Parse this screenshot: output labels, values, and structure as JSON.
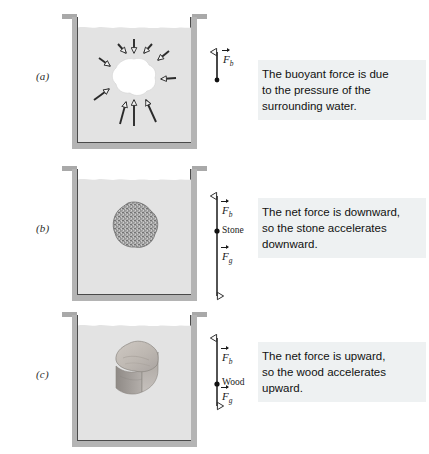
{
  "figure": {
    "background": "#ffffff",
    "width": 429,
    "height": 454
  },
  "palette": {
    "water": "#e3e3e3",
    "glass_wall": "#b4b4b4",
    "glass_rim": "#a9a9a9",
    "glass_outline": "#4a4a4a",
    "caption_background": "#eef1f2",
    "ink": "#1a1a1a",
    "stone_fill": "#9b9b9b",
    "wood_top": "#c3bdb7",
    "wood_side": "#9a948e"
  },
  "panels": [
    {
      "id": "a",
      "label": "(a)",
      "body": {
        "name": "water-cavity",
        "kind": "void",
        "description": "white irregular blob of water, same shape as the submerged body"
      },
      "arrows": {
        "name": "pressure-arrows",
        "direction": "inward",
        "count": 10,
        "arrowhead": "hollow-triangle"
      },
      "forces": [
        {
          "symbol": "F",
          "subscript": "b",
          "label": "F_b",
          "direction": "up",
          "length_px": 30,
          "arrowhead": "hollow-triangle"
        }
      ],
      "application_point": {
        "name": "application-point-dot",
        "marker": "filled-dot",
        "body_label": ""
      },
      "caption": [
        "The buoyant force is due",
        "to the pressure of the",
        "surrounding water."
      ]
    },
    {
      "id": "b",
      "label": "(b)",
      "body": {
        "name": "stone",
        "kind": "stone",
        "description": "speckled granular gray rock, denser than water"
      },
      "forces": [
        {
          "symbol": "F",
          "subscript": "b",
          "label": "F_b",
          "direction": "up",
          "length_px": 36,
          "arrowhead": "hollow-triangle"
        },
        {
          "symbol": "F",
          "subscript": "g",
          "label": "F_g",
          "direction": "down",
          "length_px": 64,
          "arrowhead": "hollow-triangle"
        }
      ],
      "application_point": {
        "name": "application-point-dot",
        "marker": "filled-dot",
        "body_label": "Stone"
      },
      "caption": [
        "The net force is downward,",
        "so the stone accelerates",
        "downward."
      ]
    },
    {
      "id": "c",
      "label": "(c)",
      "body": {
        "name": "wood-block",
        "kind": "wood",
        "description": "three dimensional block of wood, lighter than water"
      },
      "forces": [
        {
          "symbol": "F",
          "subscript": "b",
          "label": "F_b",
          "direction": "up",
          "length_px": 50,
          "arrowhead": "hollow-triangle"
        },
        {
          "symbol": "F",
          "subscript": "g",
          "label": "F_g",
          "direction": "down",
          "length_px": 22,
          "arrowhead": "hollow-triangle"
        }
      ],
      "application_point": {
        "name": "application-point-dot",
        "marker": "filled-dot",
        "body_label": "Wood"
      },
      "caption": [
        "The net force is upward,",
        "so the wood accelerates",
        "upward."
      ]
    }
  ]
}
